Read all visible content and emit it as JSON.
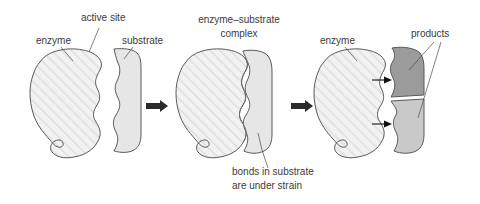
{
  "figure": {
    "background": "#ffffff",
    "text_color": "#3b3b3b",
    "outline_color": "#595959"
  },
  "colors": {
    "enzyme_fill": "#f0f0f0",
    "enzyme_hatch": "#dcdcdc",
    "substrate_fill": "#e6e6e6",
    "product_upper_fill": "#9b9b9b",
    "product_lower_fill": "#c9c9c9",
    "arrow": "#2b2b2b"
  },
  "panels": [
    {
      "id": "panel-1",
      "name": "free enzyme and substrate",
      "labels": [
        {
          "id": "enzyme",
          "text": "enzyme",
          "x": 36,
          "y": 44,
          "anchor": "start"
        },
        {
          "id": "active-site",
          "text": "active site",
          "x": 81,
          "y": 21,
          "anchor": "start"
        },
        {
          "id": "substrate",
          "text": "substrate",
          "x": 122,
          "y": 44,
          "anchor": "start"
        }
      ]
    },
    {
      "id": "panel-2",
      "name": "enzyme-substrate complex",
      "labels": [
        {
          "id": "complex-line-1",
          "text": "enzyme–substrate",
          "x": 239,
          "y": 23,
          "anchor": "middle"
        },
        {
          "id": "complex-line-2",
          "text": "complex",
          "x": 239,
          "y": 37,
          "anchor": "middle"
        },
        {
          "id": "strain-line-1",
          "text": "bonds in substrate",
          "x": 232,
          "y": 175,
          "anchor": "start"
        },
        {
          "id": "strain-line-2",
          "text": "are under strain",
          "x": 232,
          "y": 189,
          "anchor": "start"
        }
      ]
    },
    {
      "id": "panel-3",
      "name": "enzyme and released products",
      "labels": [
        {
          "id": "enzyme-3",
          "text": "enzyme",
          "x": 320,
          "y": 44,
          "anchor": "start"
        },
        {
          "id": "products",
          "text": "products",
          "x": 411,
          "y": 37,
          "anchor": "start"
        }
      ]
    }
  ],
  "arrows": {
    "step_1_to_2": {
      "name": "reaction-arrow-1",
      "x": 146,
      "y": 106
    },
    "step_2_to_3": {
      "name": "reaction-arrow-2",
      "x": 291,
      "y": 106
    },
    "release_upper": {
      "name": "product-release-arrow-upper",
      "x": 372,
      "y": 80
    },
    "release_lower": {
      "name": "product-release-arrow-lower",
      "x": 372,
      "y": 124
    }
  }
}
